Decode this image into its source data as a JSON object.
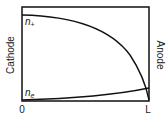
{
  "diagram": {
    "left_label": "Cathode",
    "right_label": "Anode",
    "x_start_label": "0",
    "x_end_label": "L",
    "curves": [
      {
        "name": "n_plus",
        "label_base": "n",
        "label_sub": "+",
        "description": "ion density, high at cathode, falls to ~0 at anode"
      },
      {
        "name": "n_e",
        "label_base": "n",
        "label_sub": "e",
        "description": "electron density, ~0 at cathode, rises slowly toward anode"
      }
    ],
    "colors": {
      "line": "#111111",
      "text": "#222222",
      "background": "#ffffff"
    }
  }
}
